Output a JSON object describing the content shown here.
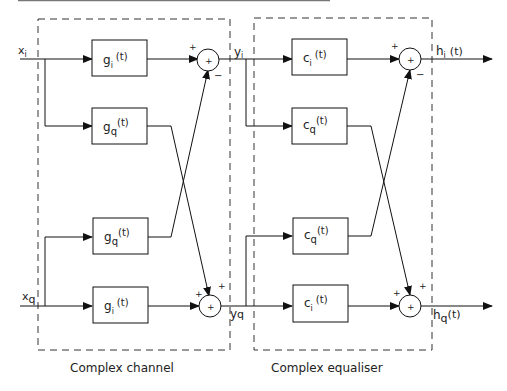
{
  "diagram": {
    "channel_block": {
      "title": "Complex channel",
      "input_i": "x",
      "input_i_sub": "i",
      "input_q": "x",
      "input_q_sub": "q",
      "output_i": "y",
      "output_i_sub": "i",
      "output_q": "y",
      "output_q_sub": "q",
      "filters": [
        {
          "name": "g",
          "sub": "i",
          "arg": "(t)"
        },
        {
          "name": "g",
          "sub": "q",
          "arg": "(t)"
        },
        {
          "name": "g",
          "sub": "q",
          "arg": "(t)"
        },
        {
          "name": "g",
          "sub": "i",
          "arg": "(t)"
        }
      ],
      "summer_top": {
        "symbol": "+",
        "sign_left": "+",
        "sign_bottom": "−"
      },
      "summer_bottom": {
        "symbol": "+",
        "sign_left": "+",
        "sign_top": "+"
      }
    },
    "equaliser_block": {
      "title": "Complex equaliser",
      "output_i": "h",
      "output_i_sub": "i",
      "output_i_arg": "(t)",
      "output_q": "h",
      "output_q_sub": "q",
      "output_q_arg": "(t)",
      "filters": [
        {
          "name": "c",
          "sub": "i",
          "arg": "(t)"
        },
        {
          "name": "c",
          "sub": "q",
          "arg": "(t)"
        },
        {
          "name": "c",
          "sub": "q",
          "arg": "(t)"
        },
        {
          "name": "c",
          "sub": "i",
          "arg": "(t)"
        }
      ],
      "summer_top": {
        "symbol": "+",
        "sign_left": "+",
        "sign_bottom": "−"
      },
      "summer_bottom": {
        "symbol": "+",
        "sign_left": "+",
        "sign_top": "+"
      }
    }
  }
}
